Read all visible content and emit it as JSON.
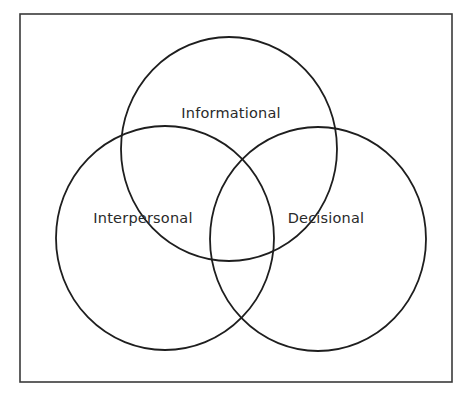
{
  "diagram": {
    "type": "venn",
    "frame": {
      "x": 20,
      "y": 14,
      "width": 432,
      "height": 368,
      "color": "#3a3a3a"
    },
    "line_color": "#1e1e1e",
    "sets": [
      {
        "id": "informational",
        "label": "Informational",
        "cx": 229,
        "cy": 149,
        "rx": 108,
        "ry": 112,
        "label_x": 231,
        "label_y": 118
      },
      {
        "id": "interpersonal",
        "label": "Interpersonal",
        "cx": 165,
        "cy": 238,
        "rx": 109,
        "ry": 112,
        "label_x": 143,
        "label_y": 223
      },
      {
        "id": "decisional",
        "label": "Decisional",
        "cx": 318,
        "cy": 239,
        "rx": 108,
        "ry": 112,
        "label_x": 326,
        "label_y": 223
      }
    ]
  }
}
